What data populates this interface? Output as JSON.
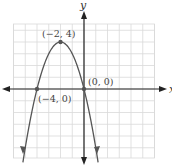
{
  "chart_data": {
    "type": "line",
    "title": "",
    "xlabel": "x",
    "ylabel": "y",
    "xlim": [
      -6,
      6
    ],
    "ylim": [
      -6,
      5.5
    ],
    "grid": true,
    "function": "y = -x^2 - 4x",
    "series": [
      {
        "name": "parabola",
        "x": [
          -6.4,
          -6,
          -5,
          -4,
          -3,
          -2,
          -1,
          0,
          1,
          1.4
        ],
        "y": [
          -15.36,
          -12,
          -5,
          0,
          3,
          4,
          3,
          0,
          -5,
          -7.56
        ]
      }
    ],
    "points": [
      {
        "label": "(−2, 4)",
        "x": -2,
        "y": 4
      },
      {
        "label": "(−4, 0)",
        "x": -4,
        "y": 0
      },
      {
        "label": "(0, 0)",
        "x": 0,
        "y": 0
      }
    ],
    "colors": {
      "curve": "#555555",
      "axis": "#222222",
      "grid": "#d9d9d9",
      "point": "#555555"
    }
  },
  "labels": {
    "x_axis": "x",
    "y_axis": "y",
    "vertex": "(−2, 4)",
    "left_root": "(−4, 0)",
    "origin": "(0, 0)"
  }
}
